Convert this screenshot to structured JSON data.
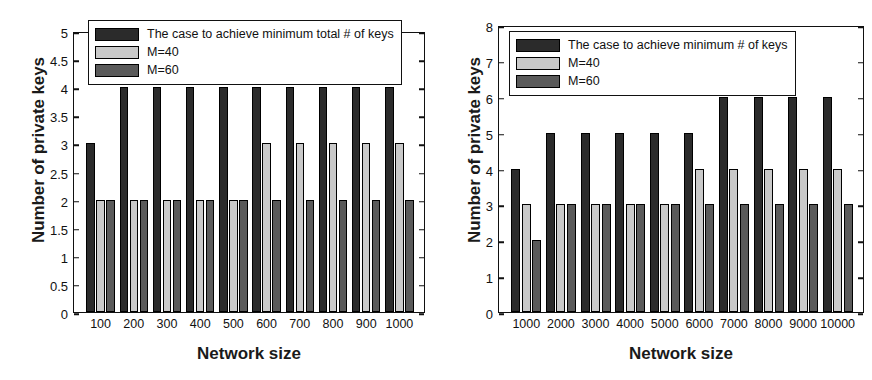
{
  "chart_data": [
    {
      "id": "left",
      "type": "bar",
      "title": "",
      "xlabel": "Network size",
      "ylabel": "Number of private keys",
      "categories": [
        "100",
        "200",
        "300",
        "400",
        "500",
        "600",
        "700",
        "800",
        "900",
        "1000"
      ],
      "series": [
        {
          "name": "The case to achieve minimum total # of keys",
          "color": "#2b2b2b",
          "values": [
            3,
            4,
            4,
            4,
            4,
            4,
            4,
            4,
            4,
            4
          ]
        },
        {
          "name": "M=40",
          "color": "#c9c9c9",
          "values": [
            2,
            2,
            2,
            2,
            2,
            3,
            3,
            3,
            3,
            3
          ]
        },
        {
          "name": "M=60",
          "color": "#5a5a5a",
          "values": [
            2,
            2,
            2,
            2,
            2,
            2,
            2,
            2,
            2,
            2
          ]
        }
      ],
      "ylim": [
        0,
        5
      ],
      "yticks": [
        "0",
        "0.5",
        "1",
        "1.5",
        "2",
        "2.5",
        "3",
        "3.5",
        "4",
        "4.5",
        "5"
      ],
      "ytick_values": [
        0,
        0.5,
        1,
        1.5,
        2,
        2.5,
        3,
        3.5,
        4,
        4.5,
        5
      ],
      "grid": false,
      "legend_position": "top-left"
    },
    {
      "id": "right",
      "type": "bar",
      "title": "",
      "xlabel": "Network size",
      "ylabel": "Number of private keys",
      "categories": [
        "1000",
        "2000",
        "3000",
        "4000",
        "5000",
        "6000",
        "7000",
        "8000",
        "9000",
        "10000"
      ],
      "series": [
        {
          "name": "The case to achieve minimum # of keys",
          "color": "#2b2b2b",
          "values": [
            4,
            5,
            5,
            5,
            5,
            5,
            6,
            6,
            6,
            6
          ]
        },
        {
          "name": "M=40",
          "color": "#c9c9c9",
          "values": [
            3,
            3,
            3,
            3,
            3,
            4,
            4,
            4,
            4,
            4
          ]
        },
        {
          "name": "M=60",
          "color": "#5a5a5a",
          "values": [
            2,
            3,
            3,
            3,
            3,
            3,
            3,
            3,
            3,
            3
          ]
        }
      ],
      "ylim": [
        0,
        8
      ],
      "yticks": [
        "0",
        "1",
        "2",
        "3",
        "4",
        "5",
        "6",
        "7",
        "8"
      ],
      "ytick_values": [
        0,
        1,
        2,
        3,
        4,
        5,
        6,
        7,
        8
      ],
      "grid": false,
      "legend_position": "top-left"
    }
  ]
}
